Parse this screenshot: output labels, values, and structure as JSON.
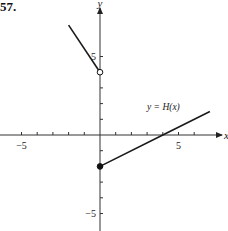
{
  "problem_number": "57.",
  "chart_data": {
    "type": "line",
    "title": "",
    "xlabel": "x",
    "ylabel": "y",
    "function_label": "y = H(x)",
    "xlim": [
      -6.4,
      8
    ],
    "ylim": [
      -6,
      8.5
    ],
    "x_ticks": [
      -5,
      -4,
      -3,
      -2,
      -1,
      1,
      2,
      3,
      4,
      5,
      6
    ],
    "y_ticks": [
      -5,
      -4,
      -3,
      -2,
      -1,
      1,
      2,
      3,
      4,
      5
    ],
    "x_tick_labels": [
      {
        "value": -5,
        "label": "−5"
      },
      {
        "value": 5,
        "label": "5"
      }
    ],
    "y_tick_labels": [
      {
        "value": 5,
        "label": "5"
      },
      {
        "value": -5,
        "label": "−5"
      }
    ],
    "grid": false,
    "series": [
      {
        "name": "H(x), x < 0",
        "points": [
          [
            -2,
            7
          ],
          [
            0,
            4
          ]
        ],
        "endpoint_at_x0": "open"
      },
      {
        "name": "H(x), x >= 0",
        "points": [
          [
            0,
            -2
          ],
          [
            4,
            0
          ],
          [
            7,
            1.5
          ]
        ],
        "endpoint_at_x0": "closed"
      }
    ],
    "markers": [
      {
        "x": 0,
        "y": 4,
        "type": "open-circle"
      },
      {
        "x": 0,
        "y": -2,
        "type": "filled-circle"
      }
    ]
  },
  "layout": {
    "origin_px": [
      100,
      135
    ],
    "unit_px": 15.7,
    "line_color": "#1a1a1a",
    "axis_color": "#333333"
  }
}
